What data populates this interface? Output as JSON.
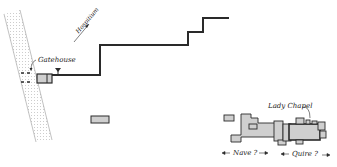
{
  "diagram": {
    "labels": {
      "gatehouse": "Gatehouse",
      "hospitium": "Hospitium",
      "lady_chapel": "Lady Chapel",
      "nave": "Nave ?",
      "quire": "Quire ?"
    },
    "colors": {
      "line": "#2a2a2a",
      "fill": "#cfcfcf",
      "road_dots": "#bdbdbd"
    }
  }
}
